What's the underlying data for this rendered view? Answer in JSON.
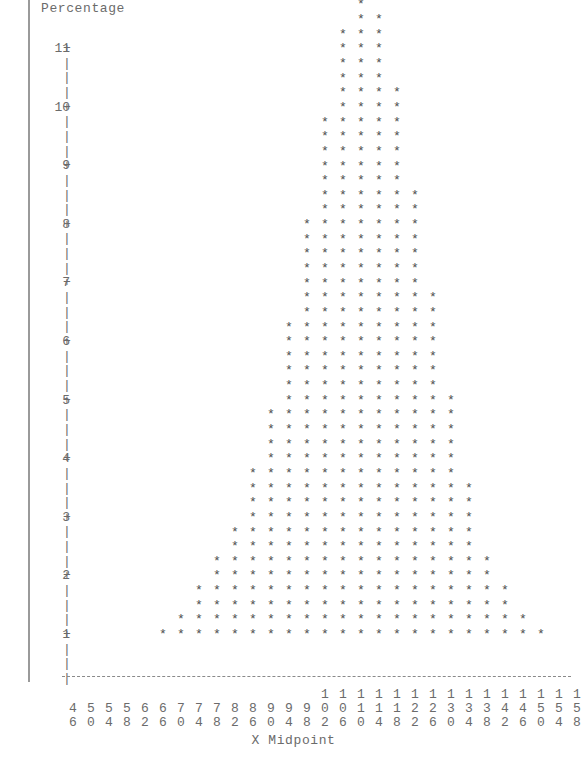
{
  "chart_data": {
    "type": "bar",
    "render_style": "ascii-dotplot-histogram",
    "title": "Percentage",
    "xlabel": "X Midpoint",
    "ylabel": "Percentage",
    "unit_per_star": 0.25,
    "ylim": [
      0,
      11.25
    ],
    "xlim": [
      44,
      160
    ],
    "grid": false,
    "legend": null,
    "y_tick_labels": [
      "11",
      "10",
      "9",
      "8",
      "7",
      "6",
      "5",
      "4",
      "3",
      "2",
      "1"
    ],
    "y_tick_values": [
      11,
      10,
      9,
      8,
      7,
      6,
      5,
      4,
      3,
      2,
      1
    ],
    "y_tick_symbol": "+",
    "y_minor_symbol": "|",
    "star_symbol": "*",
    "categories": [
      46,
      50,
      54,
      58,
      62,
      66,
      70,
      74,
      78,
      82,
      86,
      90,
      94,
      98,
      102,
      106,
      110,
      114,
      118,
      122,
      126,
      130,
      134,
      138,
      142,
      146,
      150,
      154,
      158
    ],
    "star_counts": [
      0,
      0,
      0,
      0,
      0,
      1,
      2,
      4,
      6,
      8,
      12,
      16,
      22,
      29,
      36,
      42,
      44,
      43,
      38,
      31,
      24,
      17,
      11,
      6,
      4,
      2,
      1,
      0,
      0
    ],
    "values": [
      0,
      0,
      0,
      0,
      0,
      0.25,
      0.5,
      1.0,
      1.5,
      2.0,
      3.0,
      4.0,
      5.5,
      7.25,
      9.0,
      10.5,
      11.0,
      10.75,
      9.5,
      7.75,
      6.0,
      4.25,
      2.75,
      1.5,
      1.0,
      0.5,
      0.25,
      0,
      0
    ],
    "xlabel_digit_rows": [
      [
        "",
        "",
        "",
        "",
        "",
        "",
        "",
        "",
        "",
        "",
        "",
        "",
        "",
        "",
        "1",
        "1",
        "1",
        "1",
        "1",
        "1",
        "1",
        "1",
        "1",
        "1",
        "1",
        "1",
        "1",
        "1",
        "1"
      ],
      [
        "4",
        "5",
        "5",
        "5",
        "6",
        "6",
        "7",
        "7",
        "7",
        "8",
        "8",
        "9",
        "9",
        "9",
        "0",
        "0",
        "1",
        "1",
        "1",
        "2",
        "2",
        "3",
        "3",
        "3",
        "4",
        "4",
        "5",
        "5",
        "5"
      ],
      [
        "6",
        "0",
        "4",
        "8",
        "2",
        "6",
        "0",
        "4",
        "8",
        "2",
        "6",
        "0",
        "4",
        "8",
        "2",
        "6",
        "0",
        "4",
        "8",
        "2",
        "6",
        "0",
        "4",
        "8",
        "2",
        "6",
        "0",
        "4",
        "8"
      ]
    ]
  },
  "colors": {
    "text": "#6b6b6b",
    "star": "#4e4e4e",
    "baseline": "#8a8a8a",
    "page_edge": "#9a9a9a",
    "background": "#ffffff"
  }
}
